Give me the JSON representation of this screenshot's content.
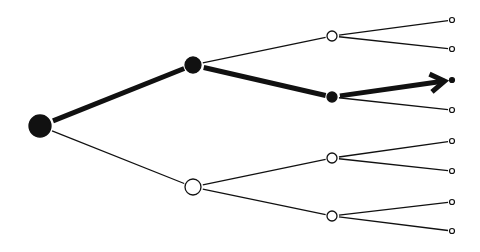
{
  "diagram": {
    "type": "decision-tree",
    "colors": {
      "stroke": "#111111",
      "background": "#ffffff",
      "hollow_fill": "#ffffff"
    },
    "nodes": [
      {
        "id": "root",
        "x": 40,
        "y": 126,
        "r": 11,
        "filled": true
      },
      {
        "id": "l1a",
        "x": 193,
        "y": 65,
        "r": 8,
        "filled": true
      },
      {
        "id": "l1b",
        "x": 193,
        "y": 187,
        "r": 8,
        "filled": false
      },
      {
        "id": "l2a",
        "x": 332,
        "y": 36,
        "r": 5,
        "filled": false
      },
      {
        "id": "l2b",
        "x": 332,
        "y": 97,
        "r": 5,
        "filled": true
      },
      {
        "id": "l2c",
        "x": 332,
        "y": 158,
        "r": 5,
        "filled": false
      },
      {
        "id": "l2d",
        "x": 332,
        "y": 216,
        "r": 5,
        "filled": false
      },
      {
        "id": "leaf1",
        "x": 452,
        "y": 20,
        "r": 2.5,
        "filled": false
      },
      {
        "id": "leaf2",
        "x": 452,
        "y": 49,
        "r": 2.5,
        "filled": false
      },
      {
        "id": "leaf3",
        "x": 452,
        "y": 80,
        "r": 2.5,
        "filled": true
      },
      {
        "id": "leaf4",
        "x": 452,
        "y": 110,
        "r": 2.5,
        "filled": false
      },
      {
        "id": "leaf5",
        "x": 452,
        "y": 141,
        "r": 2.5,
        "filled": false
      },
      {
        "id": "leaf6",
        "x": 452,
        "y": 171,
        "r": 2.5,
        "filled": false
      },
      {
        "id": "leaf7",
        "x": 452,
        "y": 202,
        "r": 2.5,
        "filled": false
      },
      {
        "id": "leaf8",
        "x": 452,
        "y": 231,
        "r": 2.5,
        "filled": false
      }
    ],
    "edges": [
      {
        "from": "root",
        "to": "l1a",
        "bold": true
      },
      {
        "from": "root",
        "to": "l1b",
        "bold": false
      },
      {
        "from": "l1a",
        "to": "l2a",
        "bold": false
      },
      {
        "from": "l1a",
        "to": "l2b",
        "bold": true
      },
      {
        "from": "l1b",
        "to": "l2c",
        "bold": false
      },
      {
        "from": "l1b",
        "to": "l2d",
        "bold": false
      },
      {
        "from": "l2a",
        "to": "leaf1",
        "bold": false
      },
      {
        "from": "l2a",
        "to": "leaf2",
        "bold": false
      },
      {
        "from": "l2b",
        "to": "leaf3",
        "bold": true,
        "arrow": true
      },
      {
        "from": "l2b",
        "to": "leaf4",
        "bold": false
      },
      {
        "from": "l2c",
        "to": "leaf5",
        "bold": false
      },
      {
        "from": "l2c",
        "to": "leaf6",
        "bold": false
      },
      {
        "from": "l2d",
        "to": "leaf7",
        "bold": false
      },
      {
        "from": "l2d",
        "to": "leaf8",
        "bold": false
      }
    ]
  }
}
